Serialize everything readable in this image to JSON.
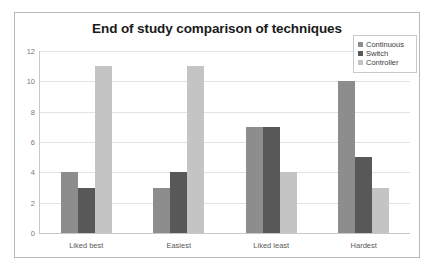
{
  "chart_data": {
    "type": "bar",
    "title": "End of study comparison of techniques",
    "xlabel": "",
    "ylabel": "",
    "categories": [
      "Liked best",
      "Easiest",
      "Liked least",
      "Hardest"
    ],
    "series": [
      {
        "name": "Continuous",
        "color": "#8d8d8d",
        "values": [
          4,
          3,
          7,
          10
        ]
      },
      {
        "name": "Switch",
        "color": "#585858",
        "values": [
          3,
          4,
          7,
          5
        ]
      },
      {
        "name": "Controller",
        "color": "#c4c4c4",
        "values": [
          11,
          11,
          4,
          3
        ]
      }
    ],
    "ylim": [
      0,
      12
    ],
    "yticks": [
      0,
      2,
      4,
      6,
      8,
      10,
      12
    ],
    "ytick_labels": [
      "0",
      "2",
      "4",
      "6",
      "8",
      "10",
      "12"
    ],
    "grid": true,
    "legend_position": "top-right"
  }
}
